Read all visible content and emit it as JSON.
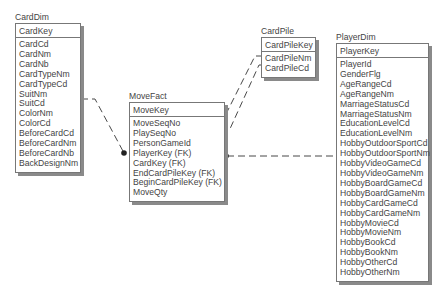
{
  "diagram": {
    "type": "entity-relationship",
    "entities": [
      {
        "id": "CardDim",
        "title": "CardDim",
        "primary_key": "CardKey",
        "attributes": [
          "CardCd",
          "CardNm",
          "CardNb",
          "CardTypeNm",
          "CardTypeCd",
          "SuitNm",
          "SuitCd",
          "ColorNm",
          "ColorCd",
          "BeforeCardCd",
          "BeforeCardNm",
          "BeforeCardNb",
          "BackDesignNm"
        ]
      },
      {
        "id": "MoveFact",
        "title": "MoveFact",
        "primary_key": "MoveKey",
        "attributes": [
          "MoveSeqNo",
          "PlaySeqNo",
          "PersonGameId",
          "PlayerKey (FK)",
          "CardKey (FK)",
          "EndCardPileKey (FK)",
          "BeginCardPileKey (FK)",
          "MoveQty"
        ]
      },
      {
        "id": "CardPile",
        "title": "CardPile",
        "primary_key": "CardPileKey",
        "attributes": [
          "CardPileNm",
          "CardPileCd"
        ]
      },
      {
        "id": "PlayerDim",
        "title": "PlayerDim",
        "primary_key": "PlayerKey",
        "attributes": [
          "PlayerId",
          "GenderFlg",
          "AgeRangeCd",
          "AgeRangeNm",
          "MarriageStatusCd",
          "MarriageStatusNm",
          "EducationLevelCd",
          "EducationLevelNm",
          "HobbyOutdoorSportCd",
          "HobbyOutdoorSportNm",
          "HobbyVideoGameCd",
          "HobbyVideoGameNm",
          "HobbyBoardGameCd",
          "HobbyBoardGameNm",
          "HobbyCardGameCd",
          "HobbyCardGameNm",
          "HobbyMovieCd",
          "HobbyMovieNm",
          "HobbyBookCd",
          "HobbyBookNm",
          "HobbyOtherCd",
          "HobbyOtherNm"
        ]
      }
    ],
    "relationships": [
      {
        "from": "CardDim",
        "to": "MoveFact",
        "style": "dashed",
        "cardinality": "one-to-many"
      },
      {
        "from": "CardPile",
        "to": "MoveFact",
        "style": "dashed",
        "cardinality": "one-to-many",
        "role": "EndCardPileKey"
      },
      {
        "from": "CardPile",
        "to": "MoveFact",
        "style": "dashed",
        "cardinality": "one-to-many",
        "role": "BeginCardPileKey"
      },
      {
        "from": "PlayerDim",
        "to": "MoveFact",
        "style": "dashed",
        "cardinality": "one-to-many"
      }
    ],
    "colors": {
      "line": "#333333",
      "border": "#777777",
      "shadow": "#8a8a8a",
      "text": "#444444"
    }
  }
}
